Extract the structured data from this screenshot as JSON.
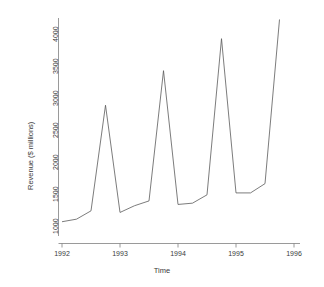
{
  "chart_data": {
    "type": "line",
    "title": "",
    "xlabel": "Time",
    "ylabel": "Revenue ($ millions)",
    "xlim": [
      1992.0,
      1996.0
    ],
    "ylim": [
      1000,
      4200
    ],
    "grid": false,
    "legend": "none",
    "xticks": [
      1992,
      1993,
      1994,
      1995,
      1996
    ],
    "xtick_labels": [
      "1992",
      "1993",
      "1994",
      "1995",
      "1996"
    ],
    "yticks": [
      1000,
      1500,
      2000,
      2500,
      3000,
      3500,
      4000
    ],
    "ytick_labels": [
      "1000",
      "1500",
      "2000",
      "2500",
      "3000",
      "3500",
      "4000"
    ],
    "series": [
      {
        "name": "Revenue",
        "color": "#5a5a5a",
        "x": [
          1992.0,
          1992.25,
          1992.5,
          1992.75,
          1993.0,
          1993.25,
          1993.5,
          1993.75,
          1994.0,
          1994.25,
          1994.5,
          1994.75,
          1995.0,
          1995.25,
          1995.5,
          1995.75
        ],
        "x_labels": [
          "1992 Q1",
          "1992 Q2",
          "1992 Q3",
          "1992 Q4",
          "1993 Q1",
          "1993 Q2",
          "1993 Q3",
          "1993 Q4",
          "1994 Q1",
          "1994 Q2",
          "1994 Q3",
          "1994 Q4",
          "1995 Q1",
          "1995 Q2",
          "1995 Q3",
          "1995 Q4"
        ],
        "values": [
          1020,
          1060,
          1190,
          2840,
          1165,
          1270,
          1345,
          3380,
          1290,
          1310,
          1440,
          3880,
          1470,
          1470,
          1615,
          4180
        ]
      }
    ]
  },
  "axes": {
    "x_title": "Time",
    "y_title": "Revenue ($ millions)"
  }
}
